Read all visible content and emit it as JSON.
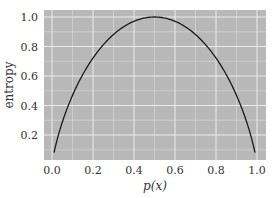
{
  "chart_data": {
    "type": "line",
    "title": "",
    "xlabel": "p(x)",
    "ylabel": "entropy",
    "xlim": [
      -0.04,
      1.04
    ],
    "ylim": [
      0.0,
      1.04
    ],
    "xticks": [
      "0.0",
      "0.2",
      "0.4",
      "0.6",
      "0.8",
      "1.0"
    ],
    "yticks": [
      "0.2",
      "0.4",
      "0.6",
      "0.8",
      "1.0"
    ],
    "grid": true,
    "legend": null,
    "series": [
      {
        "name": "binary entropy",
        "formula": "-p*log2(p) - (1-p)*log2(1-p)",
        "x": [
          0.01,
          0.05,
          0.1,
          0.15,
          0.2,
          0.25,
          0.3,
          0.35,
          0.4,
          0.45,
          0.5,
          0.55,
          0.6,
          0.65,
          0.7,
          0.75,
          0.8,
          0.85,
          0.9,
          0.95,
          0.99
        ],
        "y": [
          0.081,
          0.286,
          0.469,
          0.61,
          0.722,
          0.811,
          0.881,
          0.934,
          0.971,
          0.993,
          1.0,
          0.993,
          0.971,
          0.934,
          0.881,
          0.811,
          0.722,
          0.61,
          0.469,
          0.286,
          0.081
        ]
      }
    ],
    "colors": {
      "background": "#b8b8b8",
      "grid": "#ebebeb",
      "line": "#1a1a1a"
    }
  }
}
